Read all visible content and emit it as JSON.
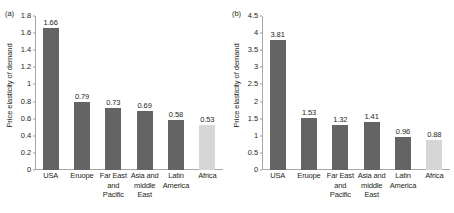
{
  "figure": {
    "panels": [
      {
        "panel_label": "(a)",
        "axis_title": "Price elasticity of demand"
      },
      {
        "panel_label": "(b)",
        "axis_title": "Price elasticity of demand"
      }
    ]
  },
  "chart_data": [
    {
      "type": "bar",
      "title": "(a)",
      "xlabel": "",
      "ylabel": "Price elasticity of demand",
      "ylim": [
        0,
        1.8
      ],
      "ytick_labels": [
        "1.8",
        "1.6",
        "1.4",
        "1.2",
        "1",
        "0.8",
        "0.6",
        "0.4",
        "0.2",
        "0"
      ],
      "yticks": [
        1.8,
        1.6,
        1.4,
        1.2,
        1,
        0.8,
        0.6,
        0.4,
        0.2,
        0
      ],
      "grid": false,
      "legend": "none",
      "categories": [
        "USA",
        "Eruope",
        "Far East and Pacific",
        "Asia and middle East",
        "Latin America",
        "Africa"
      ],
      "category_lines": [
        [
          "USA"
        ],
        [
          "Eruope"
        ],
        [
          "Far East",
          "and",
          "Pacific"
        ],
        [
          "Asia and",
          "middle",
          "East"
        ],
        [
          "Latin",
          "America"
        ],
        [
          "Africa"
        ]
      ],
      "values": [
        1.66,
        0.79,
        0.73,
        0.69,
        0.58,
        0.53
      ],
      "value_labels": [
        "1.66",
        "0.79",
        "0.73",
        "0.69",
        "0.58",
        "0.53"
      ],
      "bar_colors": [
        "#646464",
        "#646464",
        "#646464",
        "#646464",
        "#646464",
        "#d6d6d6"
      ]
    },
    {
      "type": "bar",
      "title": "(b)",
      "xlabel": "",
      "ylabel": "Price elasticity of demand",
      "ylim": [
        0,
        4.5
      ],
      "ytick_labels": [
        "4.5",
        "4",
        "3.5",
        "3",
        "2.5",
        "2",
        "1.5",
        "1",
        "0.5",
        "0"
      ],
      "yticks": [
        4.5,
        4,
        3.5,
        3,
        2.5,
        2,
        1.5,
        1,
        0.5,
        0
      ],
      "grid": false,
      "legend": "none",
      "categories": [
        "USA",
        "Eruope",
        "Far East and Pacific",
        "Asia and middle East",
        "Latin America",
        "Africa"
      ],
      "category_lines": [
        [
          "USA"
        ],
        [
          "Eruope"
        ],
        [
          "Far East",
          "and",
          "Pacific"
        ],
        [
          "Asia and",
          "middle",
          "East"
        ],
        [
          "Latin",
          "America"
        ],
        [
          "Africa"
        ]
      ],
      "values": [
        3.81,
        1.53,
        1.32,
        1.41,
        0.96,
        0.88
      ],
      "value_labels": [
        "3.81",
        "1.53",
        "1.32",
        "1.41",
        "0.96",
        "0.88"
      ],
      "bar_colors": [
        "#646464",
        "#646464",
        "#646464",
        "#646464",
        "#646464",
        "#d6d6d6"
      ]
    }
  ]
}
